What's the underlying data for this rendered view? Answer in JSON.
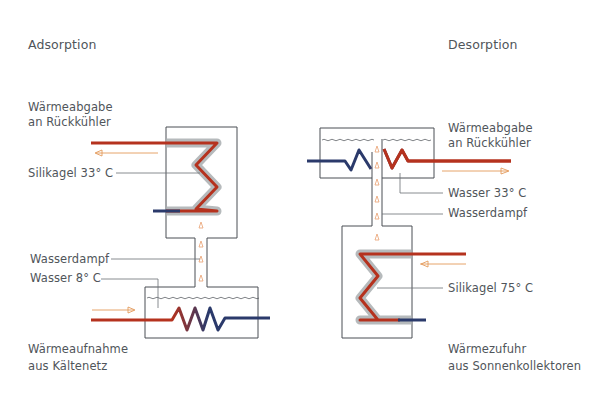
{
  "colors": {
    "hot_pipe": "#b5321e",
    "cold_pipe": "#2b3a6b",
    "silica_gel": "#a9aeb0",
    "vessel_outline": "#4a4f54",
    "vapor_arrow": "#e8a070",
    "flow_arrow": "#e39a5a",
    "leader_line": "#6a6f74",
    "text": "#50555a"
  },
  "adsorption": {
    "title": "Adsorption",
    "heat_release_line1": "Wärmeabgabe",
    "heat_release_line2": "an Rückkühler",
    "silica_gel": "Silikagel 33° C",
    "water_vapor": "Wasserdampf",
    "water": "Wasser 8° C",
    "heat_intake_line1": "Wärmeaufnahme",
    "heat_intake_line2": "aus Kältenetz"
  },
  "desorption": {
    "title": "Desorption",
    "heat_release_line1": "Wärmeabgabe",
    "heat_release_line2": "an Rückkühler",
    "water": "Wasser 33° C",
    "water_vapor": "Wasserdampf",
    "silica_gel": "Silikagel 75° C",
    "heat_supply_line1": "Wärmezufuhr",
    "heat_supply_line2": "aus Sonnenkollektoren"
  }
}
